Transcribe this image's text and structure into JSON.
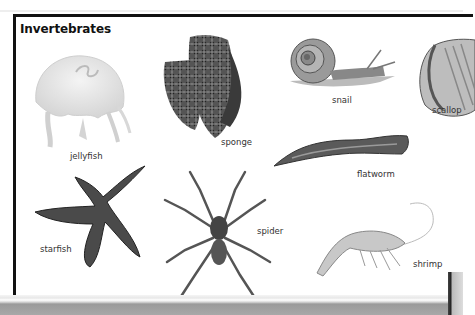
{
  "page": {
    "title": "Invertebrates"
  },
  "specimens": [
    {
      "name": "jellyfish",
      "label": "jellyfish"
    },
    {
      "name": "sponge",
      "label": "sponge"
    },
    {
      "name": "snail",
      "label": "snail"
    },
    {
      "name": "scallop",
      "label": "scallop"
    },
    {
      "name": "flatworm",
      "label": "flatworm"
    },
    {
      "name": "starfish",
      "label": "starfish"
    },
    {
      "name": "spider",
      "label": "spider"
    },
    {
      "name": "shrimp",
      "label": "shrimp"
    }
  ],
  "colors": {
    "frame": "#111111",
    "text": "#333333",
    "background": "#ffffff"
  }
}
